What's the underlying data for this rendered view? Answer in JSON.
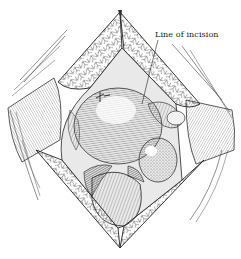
{
  "figure": {
    "type": "surgical illustration",
    "style": "grayscale line engraving",
    "annotations": [
      {
        "text": "Line of incision",
        "position": "top-right"
      }
    ]
  },
  "colors": {
    "background": "#ffffff",
    "ink": "#1a1a1a",
    "shade": "#7a7a7a",
    "light": "#d9d9d9"
  }
}
